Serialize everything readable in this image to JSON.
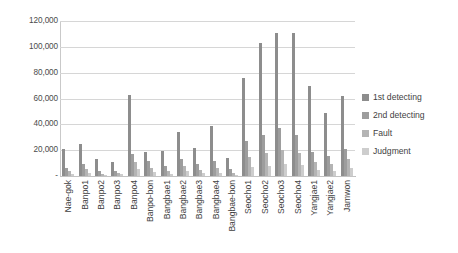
{
  "chart_data": {
    "type": "bar",
    "title": "",
    "subtitle": "",
    "xlabel": "",
    "ylabel": "",
    "ylim": [
      0,
      120000
    ],
    "ytick_values": [
      0,
      20000,
      40000,
      60000,
      80000,
      100000,
      120000
    ],
    "ytick_labels": [
      "-",
      "20,000",
      "40,000",
      "60,000",
      "80,000",
      "100,000",
      "120,000"
    ],
    "grid": true,
    "legend_position": "right",
    "categories": [
      "Nae-gok",
      "Banpo1",
      "Banpo2",
      "Banpo3",
      "Banpo4",
      "Banpo-bon",
      "Bangbae1",
      "Bangbae2",
      "Bangbae3",
      "Bangbae4",
      "Bangbae-bon",
      "Seocho1",
      "Seocho2",
      "Seocho3",
      "Seocho4",
      "Yangjae1",
      "Yangjae2",
      "Jamwon"
    ],
    "series": [
      {
        "name": "1st detecting",
        "color": "#8d8d8d",
        "values": [
          21000,
          25000,
          13000,
          10500,
          63000,
          18500,
          19000,
          34000,
          22000,
          39000,
          14000,
          76000,
          103000,
          111000,
          111000,
          70000,
          49000,
          62000
        ]
      },
      {
        "name": "2nd detecting",
        "color": "#9d9d9d",
        "values": [
          6000,
          9500,
          3500,
          4000,
          17000,
          11500,
          7500,
          13500,
          9000,
          11500,
          5500,
          27000,
          31500,
          37000,
          31500,
          18500,
          15500,
          21000
        ]
      },
      {
        "name": "Fault",
        "color": "#b4b4b4",
        "values": [
          3500,
          5500,
          1500,
          2500,
          10500,
          6500,
          4000,
          7500,
          4500,
          6000,
          2500,
          15000,
          17500,
          20000,
          17500,
          11000,
          9000,
          13000
        ]
      },
      {
        "name": "Judgment",
        "color": "#cdcdcd",
        "values": [
          1500,
          2500,
          700,
          1200,
          5500,
          3000,
          1800,
          3500,
          2000,
          2500,
          1000,
          7000,
          8000,
          9500,
          8500,
          5000,
          4000,
          6000
        ]
      }
    ]
  },
  "legend": {
    "items": [
      {
        "label": "1st detecting"
      },
      {
        "label": "2nd detecting"
      },
      {
        "label": "Fault"
      },
      {
        "label": "Judgment"
      }
    ]
  }
}
